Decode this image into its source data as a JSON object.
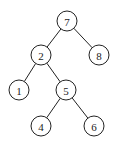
{
  "diagram": {
    "type": "binary-tree",
    "nodes": [
      {
        "id": "n7",
        "label": "7",
        "x": 67,
        "y": 21
      },
      {
        "id": "n2",
        "label": "2",
        "x": 41,
        "y": 55
      },
      {
        "id": "n8",
        "label": "8",
        "x": 99,
        "y": 55
      },
      {
        "id": "n1",
        "label": "1",
        "x": 19,
        "y": 90
      },
      {
        "id": "n5",
        "label": "5",
        "x": 66,
        "y": 90
      },
      {
        "id": "n4",
        "label": "4",
        "x": 41,
        "y": 126
      },
      {
        "id": "n6",
        "label": "6",
        "x": 94,
        "y": 126
      }
    ],
    "edges": [
      {
        "from": "n7",
        "to": "n2"
      },
      {
        "from": "n7",
        "to": "n8"
      },
      {
        "from": "n2",
        "to": "n1"
      },
      {
        "from": "n2",
        "to": "n5"
      },
      {
        "from": "n5",
        "to": "n4"
      },
      {
        "from": "n5",
        "to": "n6"
      }
    ],
    "radius": 10
  }
}
